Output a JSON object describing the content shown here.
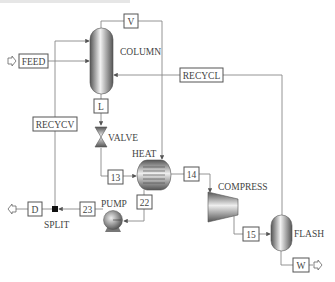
{
  "diagram": {
    "type": "process-flow-diagram",
    "colors": {
      "line": "#888888",
      "equipment_dark": "#555555",
      "equipment_light": "#e8e8e8",
      "box_border": "#555555"
    },
    "units": [
      {
        "id": "COLUMN",
        "label": "COLUMN",
        "kind": "distillation-column"
      },
      {
        "id": "VALVE",
        "label": "VALVE",
        "kind": "valve"
      },
      {
        "id": "HEAT",
        "label": "HEAT",
        "kind": "heat-exchanger"
      },
      {
        "id": "COMPRESS",
        "label": "COMPRESS",
        "kind": "compressor"
      },
      {
        "id": "FLASH",
        "label": "FLASH",
        "kind": "flash-drum"
      },
      {
        "id": "PUMP",
        "label": "PUMP",
        "kind": "pump"
      },
      {
        "id": "SPLIT",
        "label": "SPLIT",
        "kind": "splitter"
      }
    ],
    "streams": [
      {
        "id": "FEED",
        "label": "FEED",
        "from": "inlet",
        "to": "COLUMN"
      },
      {
        "id": "V",
        "label": "V",
        "from": "COLUMN",
        "to": "HEAT"
      },
      {
        "id": "L",
        "label": "L",
        "from": "COLUMN",
        "to": "VALVE"
      },
      {
        "id": "RECYCV",
        "label": "RECYCV",
        "from": "SPLIT",
        "to": "COLUMN"
      },
      {
        "id": "RECYCL",
        "label": "RECYCL",
        "from": "FLASH",
        "to": "COLUMN"
      },
      {
        "id": "13",
        "label": "13",
        "from": "VALVE",
        "to": "HEAT"
      },
      {
        "id": "14",
        "label": "14",
        "from": "HEAT",
        "to": "COMPRESS"
      },
      {
        "id": "15",
        "label": "15",
        "from": "COMPRESS",
        "to": "FLASH"
      },
      {
        "id": "22",
        "label": "22",
        "from": "HEAT",
        "to": "PUMP"
      },
      {
        "id": "23",
        "label": "23",
        "from": "PUMP",
        "to": "SPLIT"
      },
      {
        "id": "D",
        "label": "D",
        "from": "SPLIT",
        "to": "outlet"
      },
      {
        "id": "W",
        "label": "W",
        "from": "FLASH",
        "to": "outlet"
      }
    ]
  }
}
